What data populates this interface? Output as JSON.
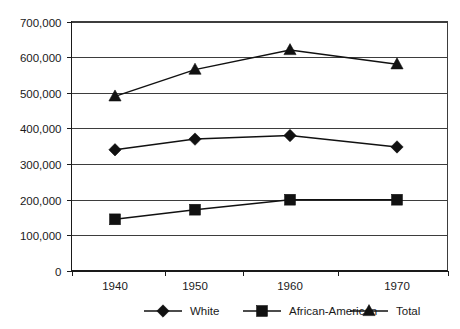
{
  "chart_data": {
    "type": "line",
    "title": "",
    "subtitle": "",
    "xlabel": "",
    "ylabel": "",
    "categories": [
      "1940",
      "1950",
      "1960",
      "1970"
    ],
    "x": [
      1940,
      1950,
      1960,
      1970
    ],
    "ylim": [
      0,
      700000
    ],
    "ytick_values": [
      0,
      100000,
      200000,
      300000,
      400000,
      500000,
      600000,
      700000
    ],
    "ytick_labels": [
      "0",
      "100,000",
      "200,000",
      "300,000",
      "400,000",
      "500,000",
      "600,000",
      "700,000"
    ],
    "xtick_labels": [
      "1940",
      "1950",
      "1960",
      "1970"
    ],
    "grid": "horizontal",
    "legend_position": "bottom",
    "series": [
      {
        "name": "White",
        "marker": "diamond",
        "color": "#111111",
        "values": [
          340000,
          370000,
          380000,
          348000
        ]
      },
      {
        "name": "African-American",
        "marker": "square",
        "color": "#111111",
        "values": [
          145000,
          172000,
          200000,
          200000
        ]
      },
      {
        "name": "Total",
        "marker": "triangle",
        "color": "#111111",
        "values": [
          490000,
          565000,
          620000,
          580000
        ]
      }
    ],
    "annotations": []
  },
  "legend": {
    "entries": [
      {
        "label": "White",
        "marker": "diamond-marker-icon"
      },
      {
        "label": "African-American",
        "marker": "square-marker-icon"
      },
      {
        "label": "Total",
        "marker": "triangle-marker-icon"
      }
    ]
  },
  "colors": {
    "ink": "#111111",
    "grid": "#3d3d3d",
    "background": "#ffffff"
  }
}
